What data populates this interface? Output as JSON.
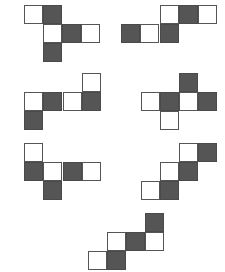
{
  "diagram": {
    "title": "",
    "colors": {
      "dark": "#555555",
      "light": "#ffffff",
      "border": "#555555"
    },
    "square_size": 19,
    "figures": [
      {
        "id": "net-1",
        "squares": [
          {
            "x": 24,
            "y": 5,
            "fill": "light"
          },
          {
            "x": 43,
            "y": 5,
            "fill": "dark"
          },
          {
            "x": 43,
            "y": 24,
            "fill": "light"
          },
          {
            "x": 62,
            "y": 24,
            "fill": "dark"
          },
          {
            "x": 81,
            "y": 24,
            "fill": "light"
          },
          {
            "x": 43,
            "y": 43,
            "fill": "dark"
          }
        ]
      },
      {
        "id": "net-2",
        "squares": [
          {
            "x": 160,
            "y": 5,
            "fill": "light"
          },
          {
            "x": 179,
            "y": 5,
            "fill": "dark"
          },
          {
            "x": 198,
            "y": 5,
            "fill": "light"
          },
          {
            "x": 121,
            "y": 24,
            "fill": "dark"
          },
          {
            "x": 140,
            "y": 24,
            "fill": "light"
          },
          {
            "x": 160,
            "y": 24,
            "fill": "dark"
          }
        ]
      },
      {
        "id": "net-3",
        "squares": [
          {
            "x": 82,
            "y": 73,
            "fill": "light"
          },
          {
            "x": 24,
            "y": 92,
            "fill": "light"
          },
          {
            "x": 43,
            "y": 92,
            "fill": "dark"
          },
          {
            "x": 63,
            "y": 92,
            "fill": "light"
          },
          {
            "x": 82,
            "y": 92,
            "fill": "dark"
          },
          {
            "x": 24,
            "y": 111,
            "fill": "dark"
          }
        ]
      },
      {
        "id": "net-4",
        "squares": [
          {
            "x": 179,
            "y": 73,
            "fill": "dark"
          },
          {
            "x": 141,
            "y": 92,
            "fill": "light"
          },
          {
            "x": 160,
            "y": 92,
            "fill": "dark"
          },
          {
            "x": 179,
            "y": 92,
            "fill": "light"
          },
          {
            "x": 198,
            "y": 92,
            "fill": "dark"
          },
          {
            "x": 160,
            "y": 111,
            "fill": "light"
          }
        ]
      },
      {
        "id": "net-5",
        "squares": [
          {
            "x": 24,
            "y": 143,
            "fill": "light"
          },
          {
            "x": 24,
            "y": 162,
            "fill": "dark"
          },
          {
            "x": 43,
            "y": 162,
            "fill": "light"
          },
          {
            "x": 63,
            "y": 162,
            "fill": "dark"
          },
          {
            "x": 82,
            "y": 162,
            "fill": "light"
          },
          {
            "x": 43,
            "y": 181,
            "fill": "dark"
          }
        ]
      },
      {
        "id": "net-6",
        "squares": [
          {
            "x": 179,
            "y": 143,
            "fill": "light"
          },
          {
            "x": 198,
            "y": 143,
            "fill": "dark"
          },
          {
            "x": 160,
            "y": 162,
            "fill": "light"
          },
          {
            "x": 179,
            "y": 162,
            "fill": "dark"
          },
          {
            "x": 141,
            "y": 181,
            "fill": "light"
          },
          {
            "x": 160,
            "y": 181,
            "fill": "dark"
          }
        ]
      },
      {
        "id": "net-7",
        "squares": [
          {
            "x": 145,
            "y": 213,
            "fill": "dark"
          },
          {
            "x": 107,
            "y": 232,
            "fill": "light"
          },
          {
            "x": 126,
            "y": 232,
            "fill": "dark"
          },
          {
            "x": 145,
            "y": 232,
            "fill": "light"
          },
          {
            "x": 88,
            "y": 251,
            "fill": "light"
          },
          {
            "x": 107,
            "y": 251,
            "fill": "dark"
          }
        ]
      }
    ]
  }
}
